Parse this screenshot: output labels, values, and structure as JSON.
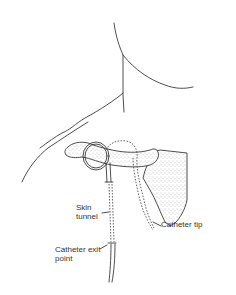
{
  "figure": {
    "labels": {
      "skin_tunnel": [
        "Skin",
        "tunnel"
      ],
      "catheter_tip": "Catheter tip",
      "catheter_exit_point": [
        "Catheter exit",
        "point"
      ]
    },
    "colors": {
      "line": "#3a3a3a",
      "background": "#ffffff",
      "stipple": "#8a8a8a"
    }
  }
}
